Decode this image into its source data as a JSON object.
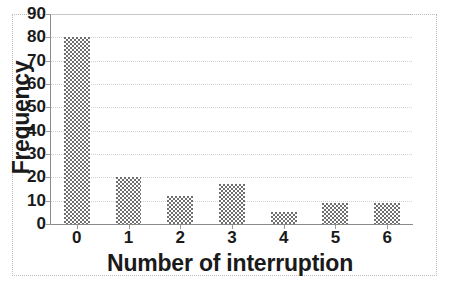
{
  "chart_data": {
    "type": "bar",
    "title": "",
    "xlabel": "Number of interruption",
    "ylabel": "Frequency",
    "categories": [
      "0",
      "1",
      "2",
      "3",
      "4",
      "5",
      "6"
    ],
    "values": [
      80,
      20,
      12,
      17,
      5,
      9,
      9
    ],
    "ylim": [
      0,
      90
    ],
    "ytick_labels": [
      "0",
      "10",
      "20",
      "30",
      "40",
      "50",
      "60",
      "70",
      "80",
      "90"
    ],
    "ytick_values": [
      0,
      10,
      20,
      30,
      40,
      50,
      60,
      70,
      80,
      90
    ],
    "ytick_step": 10,
    "xtick_labels": [
      "0",
      "1",
      "2",
      "3",
      "4",
      "5",
      "6"
    ],
    "grid": true,
    "grid_axis": "y",
    "legend": false,
    "legend_position": "none",
    "series": [
      {
        "name": "Frequency",
        "values": [
          80,
          20,
          12,
          17,
          5,
          9,
          9
        ]
      }
    ],
    "colors": {
      "bar_fill": "#8d8d8d",
      "bar_pattern": "#6f6f6f",
      "gridline": "#d2d2d2",
      "axis_line": "#8a8a8a",
      "text": "#1a1a1a",
      "background": "#ffffff",
      "frame_border": "#bdbdbd"
    }
  }
}
